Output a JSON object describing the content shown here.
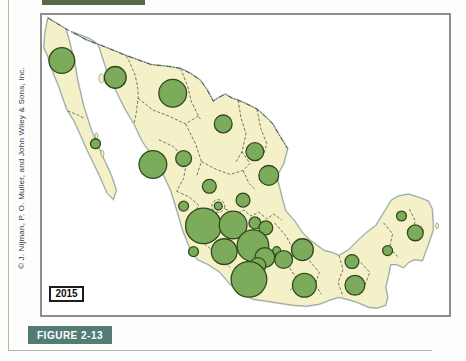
{
  "figure": {
    "label": "FIGURE 2-13",
    "year": "2015",
    "credit": "© J. Nijman, P. O. Muller, and John Wiley & Sons, Inc."
  },
  "colors": {
    "land": "#f4f0c8",
    "circle_fill": "#7dab5c",
    "circle_stroke": "#2e4a1c",
    "water_edge": "#b4d8e6",
    "figure_box": "#527c74",
    "frame": "#8e8e8e"
  },
  "map": {
    "description": "Proportional-symbol map of Mexico; one green circle per state",
    "circles": [
      {
        "name": "baja-california",
        "cx": 20,
        "cy": 46,
        "r": 13
      },
      {
        "name": "sonora",
        "cx": 74,
        "cy": 63,
        "r": 11
      },
      {
        "name": "chihuahua",
        "cx": 132,
        "cy": 79,
        "r": 14
      },
      {
        "name": "coahuila",
        "cx": 183,
        "cy": 110,
        "r": 9
      },
      {
        "name": "baja-california-sur",
        "cx": 54,
        "cy": 130,
        "r": 5
      },
      {
        "name": "nuevo-leon",
        "cx": 215,
        "cy": 138,
        "r": 9
      },
      {
        "name": "sinaloa",
        "cx": 112,
        "cy": 151,
        "r": 14
      },
      {
        "name": "durango",
        "cx": 143,
        "cy": 145,
        "r": 8
      },
      {
        "name": "tamaulipas",
        "cx": 229,
        "cy": 162,
        "r": 10
      },
      {
        "name": "zacatecas",
        "cx": 169,
        "cy": 173,
        "r": 7
      },
      {
        "name": "san-luis-potosi",
        "cx": 203,
        "cy": 187,
        "r": 7
      },
      {
        "name": "nayarit",
        "cx": 143,
        "cy": 193,
        "r": 5
      },
      {
        "name": "aguascalientes",
        "cx": 178,
        "cy": 193,
        "r": 4
      },
      {
        "name": "jalisco",
        "cx": 163,
        "cy": 213,
        "r": 18
      },
      {
        "name": "guanajuato",
        "cx": 193,
        "cy": 212,
        "r": 14
      },
      {
        "name": "queretaro",
        "cx": 215,
        "cy": 210,
        "r": 6
      },
      {
        "name": "hidalgo",
        "cx": 226,
        "cy": 215,
        "r": 7
      },
      {
        "name": "colima",
        "cx": 153,
        "cy": 239,
        "r": 5
      },
      {
        "name": "michoacan",
        "cx": 184,
        "cy": 239,
        "r": 13
      },
      {
        "name": "mexico-state",
        "cx": 213,
        "cy": 233,
        "r": 16
      },
      {
        "name": "tlaxcala",
        "cx": 237,
        "cy": 238,
        "r": 4
      },
      {
        "name": "veracruz",
        "cx": 263,
        "cy": 237,
        "r": 11
      },
      {
        "name": "cdmx",
        "cx": 225,
        "cy": 245,
        "r": 10
      },
      {
        "name": "morelos",
        "cx": 218,
        "cy": 253,
        "r": 8
      },
      {
        "name": "puebla",
        "cx": 244,
        "cy": 247,
        "r": 9
      },
      {
        "name": "guerrero",
        "cx": 209,
        "cy": 267,
        "r": 18
      },
      {
        "name": "oaxaca",
        "cx": 265,
        "cy": 273,
        "r": 12
      },
      {
        "name": "tabasco",
        "cx": 313,
        "cy": 249,
        "r": 7
      },
      {
        "name": "chiapas",
        "cx": 316,
        "cy": 273,
        "r": 10
      },
      {
        "name": "campeche",
        "cx": 349,
        "cy": 238,
        "r": 5
      },
      {
        "name": "yucatan",
        "cx": 363,
        "cy": 203,
        "r": 5
      },
      {
        "name": "quintana-roo",
        "cx": 377,
        "cy": 220,
        "r": 8
      }
    ]
  }
}
